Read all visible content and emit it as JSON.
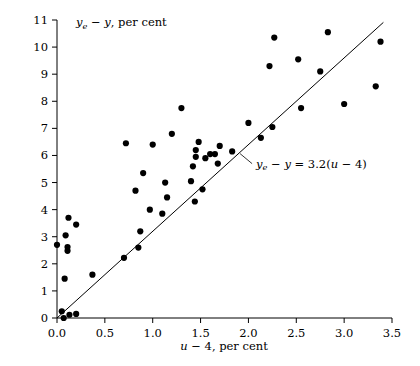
{
  "chart_data": {
    "type": "scatter",
    "title": "",
    "xlabel": "u - 4, per cent",
    "ylabel": "y_e - y, per cent",
    "xlabel_parts": {
      "italic": "u",
      "rest": " − 4, per cent"
    },
    "ylabel_parts": {
      "italic": "y",
      "sub": "e",
      "rest": " − y, per cent"
    },
    "xlim": [
      0.0,
      3.5
    ],
    "ylim": [
      0,
      11
    ],
    "xticks": [
      0.0,
      0.5,
      1.0,
      1.5,
      2.0,
      2.5,
      3.0,
      3.5
    ],
    "xticklabels": [
      "0.0",
      "0.5",
      "1.0",
      "1.5",
      "2.0",
      "2.5",
      "3.0",
      "3.5"
    ],
    "yticks": [
      0,
      1,
      2,
      3,
      4,
      5,
      6,
      7,
      8,
      9,
      10,
      11
    ],
    "yticklabels": [
      "0",
      "1",
      "2",
      "3",
      "4",
      "5",
      "6",
      "7",
      "8",
      "9",
      "10",
      "11"
    ],
    "grid": false,
    "legend": "none",
    "marker": "filled-circle",
    "marker_color": "#000000",
    "fit_line": {
      "slope": 3.2,
      "intercept": 0,
      "x_start": 0.0,
      "x_end": 3.41,
      "color": "#000000",
      "annotation": "y_e - y = 3.2(u - 4)",
      "annotation_x": 2.08,
      "annotation_y": 5.55
    },
    "points": [
      [
        0.0,
        2.7
      ],
      [
        0.05,
        0.25
      ],
      [
        0.07,
        0.0
      ],
      [
        0.08,
        1.45
      ],
      [
        0.09,
        3.05
      ],
      [
        0.11,
        2.48
      ],
      [
        0.11,
        2.62
      ],
      [
        0.12,
        3.7
      ],
      [
        0.13,
        0.12
      ],
      [
        0.2,
        0.15
      ],
      [
        0.2,
        3.45
      ],
      [
        0.37,
        1.6
      ],
      [
        0.7,
        2.22
      ],
      [
        0.72,
        6.45
      ],
      [
        0.82,
        4.7
      ],
      [
        0.85,
        2.6
      ],
      [
        0.87,
        3.2
      ],
      [
        0.9,
        5.35
      ],
      [
        0.97,
        4.0
      ],
      [
        1.0,
        6.4
      ],
      [
        1.1,
        3.85
      ],
      [
        1.13,
        5.0
      ],
      [
        1.15,
        4.45
      ],
      [
        1.2,
        6.8
      ],
      [
        1.3,
        7.75
      ],
      [
        1.4,
        5.05
      ],
      [
        1.42,
        5.6
      ],
      [
        1.44,
        4.3
      ],
      [
        1.45,
        5.95
      ],
      [
        1.45,
        6.2
      ],
      [
        1.48,
        6.5
      ],
      [
        1.52,
        4.75
      ],
      [
        1.55,
        5.9
      ],
      [
        1.6,
        6.05
      ],
      [
        1.65,
        6.05
      ],
      [
        1.68,
        5.7
      ],
      [
        1.7,
        6.35
      ],
      [
        1.83,
        6.15
      ],
      [
        2.0,
        7.2
      ],
      [
        2.13,
        6.65
      ],
      [
        2.22,
        9.3
      ],
      [
        2.25,
        7.05
      ],
      [
        2.27,
        10.35
      ],
      [
        2.52,
        9.55
      ],
      [
        2.55,
        7.75
      ],
      [
        2.75,
        9.1
      ],
      [
        2.83,
        10.55
      ],
      [
        3.0,
        7.9
      ],
      [
        3.33,
        8.55
      ],
      [
        3.38,
        10.2
      ]
    ]
  }
}
